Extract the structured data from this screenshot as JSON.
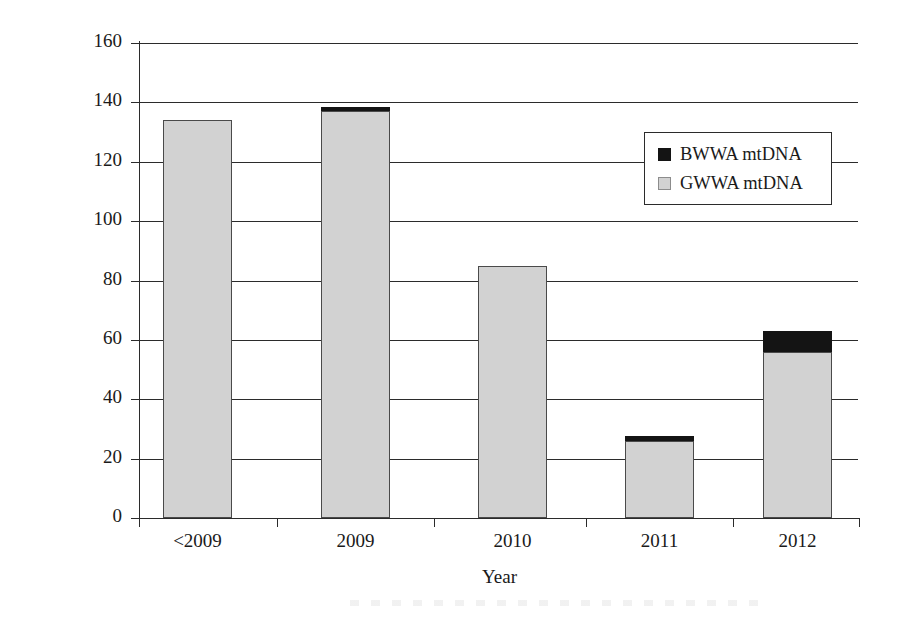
{
  "chart_data": {
    "type": "bar",
    "title": "",
    "xlabel": "Year",
    "ylabel": "No. vermivora chrysoptera sampled",
    "categories": [
      "<2009",
      "2009",
      "2010",
      "2011",
      "2012"
    ],
    "series": [
      {
        "name": "BWWA mtDNA",
        "color": "#141414",
        "values": [
          0,
          1.5,
          0,
          1.5,
          7
        ]
      },
      {
        "name": "GWWA mtDNA",
        "color": "#d2d2d2",
        "values": [
          134,
          137,
          85,
          26,
          56
        ]
      }
    ],
    "totals": [
      134,
      138.5,
      85,
      27.5,
      63
    ],
    "ylim": [
      0,
      160
    ],
    "ytick_values": [
      160,
      140,
      120,
      100,
      80,
      60,
      40,
      20,
      0
    ],
    "ytick_labels": [
      "160",
      "140",
      "120",
      "100",
      "80",
      "60",
      "40",
      "20",
      "0"
    ],
    "grid": true,
    "legend_position": "upper-right",
    "stacked": true
  },
  "axes": {
    "y_title": "No. vermivora chrysoptera sampled",
    "x_title": "Year",
    "y_ticks": [
      {
        "label": "160",
        "value": 160
      },
      {
        "label": "140",
        "value": 140
      },
      {
        "label": "120",
        "value": 120
      },
      {
        "label": "100",
        "value": 100
      },
      {
        "label": "80",
        "value": 80
      },
      {
        "label": "60",
        "value": 60
      },
      {
        "label": "40",
        "value": 40
      },
      {
        "label": "20",
        "value": 20
      },
      {
        "label": "0",
        "value": 0
      }
    ],
    "x_ticks": [
      {
        "label": "<2009"
      },
      {
        "label": "2009"
      },
      {
        "label": "2010"
      },
      {
        "label": "2011"
      },
      {
        "label": "2012"
      }
    ]
  },
  "legend": {
    "entries": [
      {
        "label": "BWWA mtDNA",
        "color": "#141414"
      },
      {
        "label": "GWWA mtDNA",
        "color": "#d2d2d2"
      }
    ]
  }
}
